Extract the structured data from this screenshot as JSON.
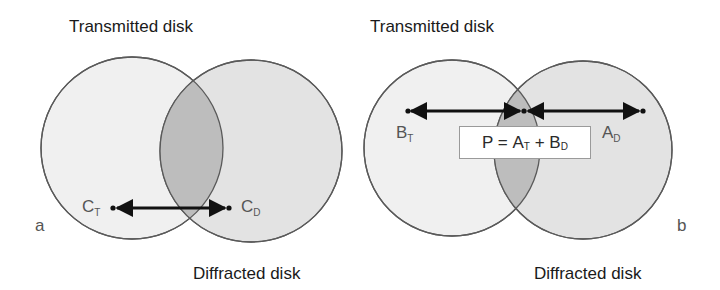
{
  "figure": {
    "panels": [
      {
        "id": "a",
        "panel_label": "a",
        "title_top": "Transmitted disk",
        "title_bottom": "Diffracted disk",
        "point_left": {
          "base": "C",
          "sub": "T"
        },
        "point_right": {
          "base": "C",
          "sub": "D"
        }
      },
      {
        "id": "b",
        "panel_label": "b",
        "title_top": "Transmitted disk",
        "title_bottom": "Diffracted disk",
        "point_left": {
          "base": "B",
          "sub": "T"
        },
        "point_right": {
          "base": "A",
          "sub": "D"
        },
        "equation": {
          "lhs": "P = ",
          "a_base": "A",
          "a_sub": "T",
          "plus": " + ",
          "b_base": "B",
          "b_sub": "D"
        }
      }
    ],
    "colors": {
      "transmitted_fill": "#f0f0f0",
      "diffracted_fill": "#e3e3e3",
      "overlap_fill": "#bdbdbd",
      "outline": "#5a5a5a",
      "arrow": "#111111"
    }
  }
}
